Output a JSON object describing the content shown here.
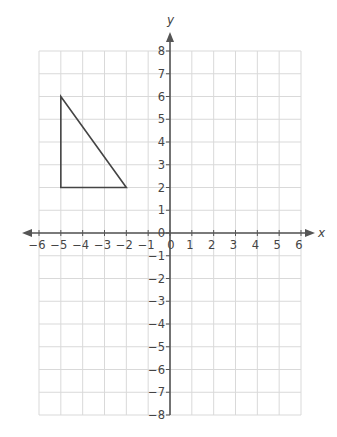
{
  "chart_data": {
    "type": "scatter",
    "title": "",
    "xlabel": "x",
    "ylabel": "y",
    "xlim": [
      -6,
      6
    ],
    "ylim": [
      -8,
      8
    ],
    "grid": true,
    "x_ticks": [
      -6,
      -5,
      -4,
      -3,
      -2,
      -1,
      0,
      1,
      2,
      3,
      4,
      5,
      6
    ],
    "y_ticks": [
      -8,
      -7,
      -6,
      -5,
      -4,
      -3,
      -2,
      -1,
      0,
      1,
      2,
      3,
      4,
      5,
      6,
      7,
      8
    ],
    "x_tick_labels": [
      "−6",
      "−5",
      "−4",
      "−3",
      "−2",
      "−1",
      "0",
      "1",
      "2",
      "3",
      "4",
      "5",
      "6"
    ],
    "y_tick_labels": [
      "−8",
      "−7",
      "−6",
      "−5",
      "−4",
      "−3",
      "−2",
      "−1",
      "0",
      "1",
      "2",
      "3",
      "4",
      "5",
      "6",
      "7",
      "8"
    ],
    "series": [
      {
        "name": "triangle",
        "shape": "polygon",
        "points": [
          [
            -5,
            6
          ],
          [
            -5,
            2
          ],
          [
            -2,
            2
          ]
        ]
      }
    ]
  },
  "colors": {
    "grid": "#d9d9d9",
    "axis": "#555555",
    "shape": "#444444",
    "text": "#444444"
  }
}
